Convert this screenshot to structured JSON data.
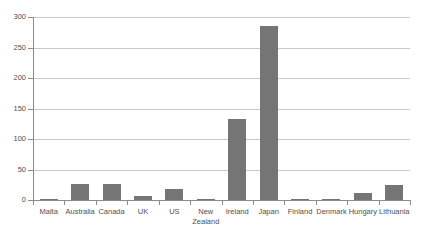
{
  "chart_data": {
    "type": "bar",
    "title": "",
    "subtitle": "",
    "xlabel": "",
    "ylabel": "",
    "categories": [
      "Malta",
      "Australia",
      "Canada",
      "UK",
      "US",
      "New\nZealand",
      "Ireland",
      "Japan",
      "Finland",
      "Denmark",
      "Hungary",
      "Lithuania"
    ],
    "values": [
      1,
      26,
      27,
      6,
      18,
      1,
      133,
      285,
      2,
      2,
      12,
      25
    ],
    "ylim": [
      0,
      300
    ],
    "yticks": [
      0,
      50,
      100,
      150,
      200,
      250,
      300
    ],
    "ytick_labels": [
      "0",
      "50",
      "100",
      "150",
      "200",
      "250",
      "300"
    ],
    "grid": true,
    "legend": false,
    "legend_position": "none",
    "bar_color": "#757575",
    "gridline_color": "#c9c9c9",
    "axis_color": "#8c8c8c",
    "text_color": "#4f4f4f"
  }
}
